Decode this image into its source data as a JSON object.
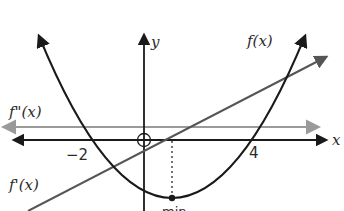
{
  "diagram": {
    "title": "",
    "axes": {
      "x_label": "x",
      "y_label": "y",
      "ticks": [
        {
          "value": -2,
          "label": "−2"
        },
        {
          "value": 4,
          "label": "4"
        }
      ]
    },
    "curves": [
      {
        "name": "f",
        "label": "f(x)",
        "type": "parabola",
        "roots": [
          -2,
          4
        ],
        "vertex_x": 1,
        "color": "#1a1a1a"
      },
      {
        "name": "f_prime",
        "label": "f'(x)",
        "type": "line",
        "root": 1,
        "color": "#555555"
      },
      {
        "name": "f_double_prime",
        "label": "f\"(x)",
        "type": "horizontal line",
        "color": "#999999"
      }
    ],
    "annotations": {
      "origin_marker": "open circle at origin",
      "min_label": "min",
      "min_x": 1
    },
    "colors": {
      "axis": "#1a1a1a",
      "f": "#1a1a1a",
      "f_prime": "#555555",
      "f_double_prime": "#9a9a9a"
    }
  }
}
